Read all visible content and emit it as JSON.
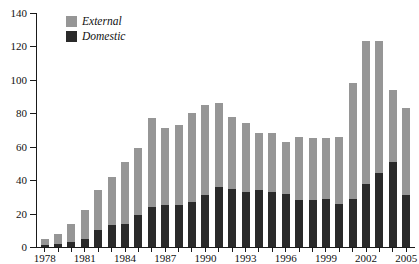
{
  "chart_data": {
    "type": "bar",
    "stacked": true,
    "title": "",
    "subtitle": "",
    "xlabel": "",
    "ylabel": "",
    "ylim": [
      0,
      140
    ],
    "yticks": [
      0,
      20,
      40,
      60,
      80,
      100,
      120,
      140
    ],
    "grid": false,
    "legend_position": "top-left",
    "categories": [
      "1978",
      "1979",
      "1980",
      "1981",
      "1982",
      "1983",
      "1984",
      "1985",
      "1986",
      "1987",
      "1988",
      "1989",
      "1990",
      "1991",
      "1992",
      "1993",
      "1994",
      "1995",
      "1996",
      "1997",
      "1998",
      "1999",
      "2000",
      "2001",
      "2002",
      "2003",
      "2004",
      "2005"
    ],
    "xtick_labels": [
      "1978",
      "1981",
      "1984",
      "1987",
      "1990",
      "1993",
      "1996",
      "1999",
      "2002",
      "2005"
    ],
    "series": [
      {
        "name": "Domestic",
        "color": "#2a2a2a",
        "values": [
          1,
          2,
          3,
          5,
          10,
          13,
          14,
          19,
          24,
          25,
          25,
          27,
          31,
          36,
          35,
          33,
          34,
          33,
          32,
          28,
          28,
          29,
          26,
          29,
          38,
          44,
          51,
          31
        ]
      },
      {
        "name": "External",
        "color": "#969696",
        "values": [
          4,
          6,
          11,
          17,
          24,
          29,
          37,
          40,
          53,
          46,
          48,
          53,
          54,
          50,
          43,
          41,
          34,
          35,
          31,
          38,
          37,
          36,
          40,
          69,
          85,
          79,
          43,
          52
        ]
      }
    ],
    "totals": [
      5,
      8,
      14,
      22,
      34,
      42,
      51,
      59,
      77,
      71,
      73,
      80,
      85,
      86,
      78,
      74,
      68,
      68,
      63,
      66,
      65,
      65,
      66,
      98,
      123,
      123,
      94,
      83
    ]
  },
  "legend": {
    "items": [
      {
        "label": "External",
        "color": "#969696",
        "swatch_name": "external-swatch"
      },
      {
        "label": "Domestic",
        "color": "#2a2a2a",
        "swatch_name": "domestic-swatch"
      }
    ]
  },
  "axes": {
    "y_labels": [
      "140",
      "120",
      "100",
      "80",
      "60",
      "40",
      "20",
      "0"
    ],
    "x_labels": [
      "1978",
      "1981",
      "1984",
      "1987",
      "1990",
      "1993",
      "1996",
      "1999",
      "2002",
      "2005"
    ]
  },
  "colors": {
    "external": "#969696",
    "domestic": "#2a2a2a",
    "axis": "#1a1a1a",
    "background": "#ffffff",
    "text": "#111111"
  }
}
